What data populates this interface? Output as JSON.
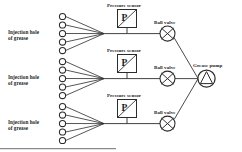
{
  "diagram": {
    "colors": {
      "stroke": "#2b2b2b",
      "background": "#ffffff",
      "text": "#1c1c1c",
      "border": "#8a8a8a"
    },
    "injection_groups": [
      {
        "label_line1": "Injection hole",
        "label_line2": "of grease",
        "hole_count": 5
      },
      {
        "label_line1": "Injection hole",
        "label_line2": "of grease",
        "hole_count": 5
      },
      {
        "label_line1": "Injection hole",
        "label_line2": "of grease",
        "hole_count": 5
      }
    ],
    "pressure_sensors": [
      {
        "label": "Pressure sensor",
        "symbol": "P"
      },
      {
        "label": "Pressure sensor",
        "symbol": "P"
      },
      {
        "label": "Pressure sensor",
        "symbol": "P"
      }
    ],
    "ball_valves": [
      {
        "label": "Ball valve"
      },
      {
        "label": "Ball valve"
      },
      {
        "label": "Ball valve"
      }
    ],
    "grease_pump": {
      "label": "Grease pump"
    }
  }
}
